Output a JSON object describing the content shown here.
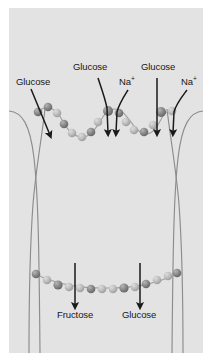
{
  "figure": {
    "type": "biology-diagram",
    "panel": {
      "background_color": "#e3e3e3",
      "border_color": "#ffffff"
    },
    "colors": {
      "membrane_line": "#8c8c8c",
      "bead_dark": "#8a8a8a",
      "bead_light": "#bdbdbd",
      "arrow": "#1a1a1a",
      "text": "#171717"
    },
    "labels": {
      "glucose_apical_left": "Glucose",
      "glucose_sglt1": "Glucose",
      "na_sglt1": "Na",
      "na_sglt1_charge": "+",
      "glucose_sglt2": "Glucose",
      "na_sglt2": "Na",
      "na_sglt2_charge": "+",
      "fructose_basal": "Fructose",
      "glucose_basal": "Glucose"
    },
    "arrows": {
      "apical": [
        {
          "name": "glucose-apical-left",
          "direction": "down-right"
        },
        {
          "name": "glucose-sglt1",
          "direction": "down"
        },
        {
          "name": "na-sglt1",
          "direction": "down"
        },
        {
          "name": "glucose-sglt2",
          "direction": "down"
        },
        {
          "name": "na-sglt2",
          "direction": "down"
        }
      ],
      "basolateral": [
        {
          "name": "fructose-basal",
          "direction": "down"
        },
        {
          "name": "glucose-basal",
          "direction": "down"
        }
      ]
    }
  }
}
